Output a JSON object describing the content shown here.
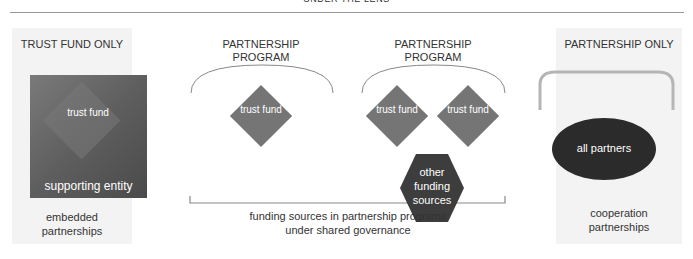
{
  "header": {
    "title": "UNDER THE LENS"
  },
  "panels": {
    "trust_fund_only": {
      "title": "TRUST FUND ONLY",
      "inner_shape_label": "trust fund",
      "box_label": "supporting entity",
      "caption_line1": "embedded",
      "caption_line2": "partnerships"
    },
    "partnership_program_1": {
      "title_line1": "PARTNERSHIP",
      "title_line2": "PROGRAM",
      "diamond_label": "trust fund"
    },
    "partnership_program_2": {
      "title_line1": "PARTNERSHIP",
      "title_line2": "PROGRAM",
      "diamond_left_label": "trust fund",
      "diamond_right_label": "trust fund",
      "hexagon_label": "other funding sources"
    },
    "shared_caption": {
      "line1": "funding sources in partnership programs",
      "line2": "under shared governance"
    },
    "partnership_only": {
      "title": "PARTNERSHIP ONLY",
      "ellipse_label": "all partners",
      "caption_line1": "cooperation",
      "caption_line2": "partnerships"
    }
  },
  "colors": {
    "panel_bg": "#f3f3f3",
    "diamond": "#757575",
    "hexagon": "#3d3d3d",
    "ellipse": "#2b2b2b",
    "arc_light": "#b5b5b5",
    "arc_dark": "#888888"
  }
}
